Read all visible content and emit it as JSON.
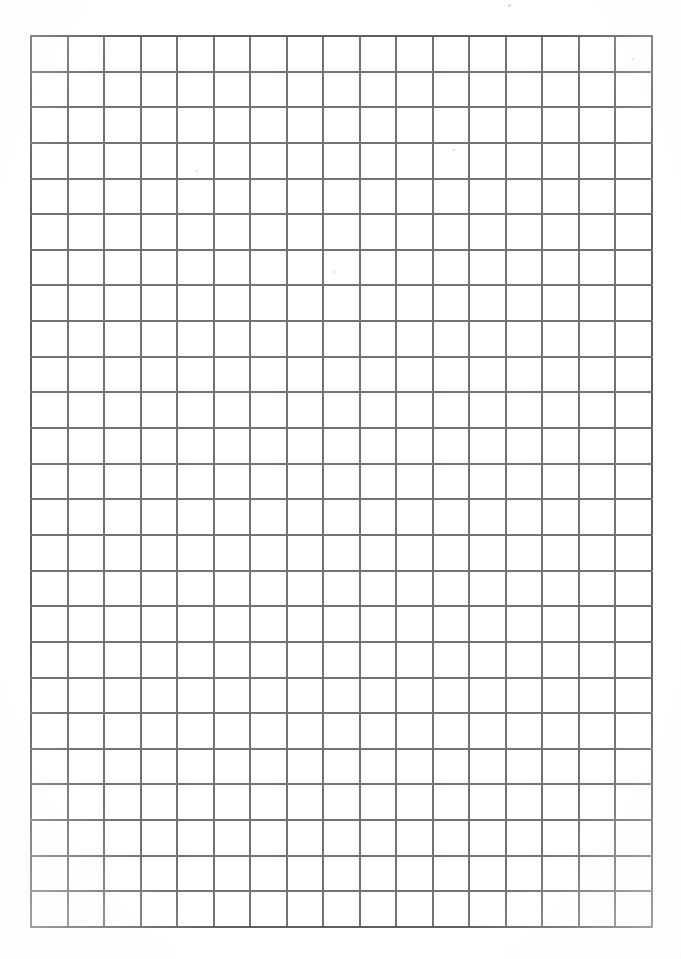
{
  "document": {
    "kind": "grid-paper-scan",
    "page_width": 681,
    "page_height": 959,
    "background_color": "#ffffff"
  },
  "grid": {
    "label": "Square grid ruling",
    "columns": 17,
    "rows": 25,
    "left": 30,
    "top": 35,
    "right": 651,
    "bottom": 926,
    "width": 621,
    "height": 891,
    "cell_width": 36.53,
    "cell_height": 35.64,
    "line_color": "#6f7276",
    "border_color": "#5c5f63",
    "line_thickness": 2,
    "border_thickness": 2
  },
  "margins": {
    "left": 30,
    "top": 35,
    "right": 30,
    "bottom": 33
  },
  "artifacts": {
    "specks": [
      {
        "x": 508,
        "y": 4,
        "size": 3
      },
      {
        "x": 196,
        "y": 170,
        "size": 2
      },
      {
        "x": 453,
        "y": 149,
        "size": 2
      },
      {
        "x": 632,
        "y": 58,
        "size": 2
      },
      {
        "x": 333,
        "y": 271,
        "size": 2
      }
    ]
  }
}
